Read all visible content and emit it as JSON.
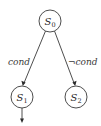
{
  "diagram": {
    "type": "state-transition",
    "nodes": [
      {
        "id": "S0",
        "label": "S",
        "subscript": "0",
        "cx": 50,
        "cy": 21,
        "r": 11
      },
      {
        "id": "S1",
        "label": "S",
        "subscript": "1",
        "cx": 22,
        "cy": 97,
        "r": 11
      },
      {
        "id": "S2",
        "label": "S",
        "subscript": "2",
        "cx": 76,
        "cy": 97,
        "r": 11
      }
    ],
    "edges": [
      {
        "from": "S0",
        "to": "S1",
        "label": "cond"
      },
      {
        "from": "S0",
        "to": "S2",
        "label": "¬cond"
      },
      {
        "from": "S1",
        "to": null,
        "label": ""
      }
    ],
    "colors": {
      "stroke": "#3a3a3a",
      "text": "#2a2a2a",
      "background": "#ffffff"
    }
  }
}
